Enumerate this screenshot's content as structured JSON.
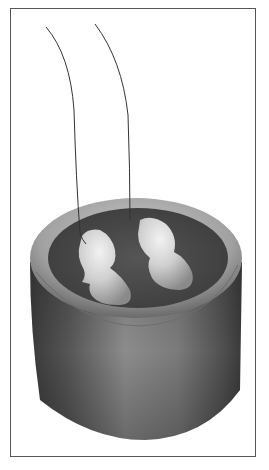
{
  "figure": {
    "colors": {
      "frame": "#555555",
      "background": "#ffffff",
      "cylinder_dark": "#3f3f3f",
      "cylinder_mid": "#7a7a7a",
      "rim_light": "#b5b5b5",
      "top_surface": "#4a4a4a",
      "blob_light": "#e0e0e0",
      "wire": "#333333"
    },
    "elements": [
      "cylinder",
      "top-surface",
      "kidney-shape-left",
      "kidney-shape-right",
      "wire-left",
      "wire-right"
    ]
  }
}
